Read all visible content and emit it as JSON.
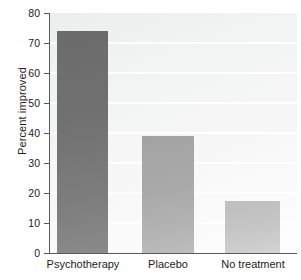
{
  "chart_data": {
    "type": "bar",
    "title": "",
    "xlabel": "",
    "ylabel": "Percent improved",
    "categories": [
      "Psychotherapy",
      "Placebo",
      "No treatment"
    ],
    "values": [
      74,
      39,
      17.5
    ],
    "ylim": [
      0,
      80
    ],
    "yticks": [
      0,
      10,
      20,
      30,
      40,
      50,
      60,
      70,
      80
    ],
    "ytick_labels": [
      "0",
      "10",
      "20",
      "30",
      "40",
      "50",
      "60",
      "70",
      "80"
    ],
    "grid": false,
    "legend": "none",
    "bar_colors": [
      "#717171",
      "#a9a9a9",
      "#c4c4c4"
    ],
    "axis_color": "#5a5a5a",
    "plot_background": "#f4f5f5",
    "text_color": "#1c1c1c"
  }
}
